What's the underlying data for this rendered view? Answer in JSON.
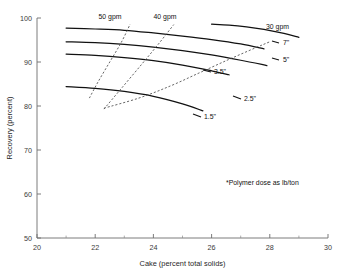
{
  "chart_data": {
    "type": "line",
    "title": "",
    "xlabel": "Cake (percent total solids)",
    "ylabel": "Recovery (percent)",
    "xlim": [
      20,
      30
    ],
    "ylim": [
      50,
      100
    ],
    "xticks": [
      20,
      22,
      24,
      26,
      28,
      30
    ],
    "xticks_minor": [
      21,
      23,
      25,
      27,
      29
    ],
    "yticks": [
      50,
      60,
      70,
      80,
      90,
      100
    ],
    "grid": false,
    "legend": "inline-end-labels",
    "footnote": "*Polymer dose as lb/ton",
    "series": [
      {
        "name": "7\"",
        "label": "7\"",
        "style": "solid",
        "group": "polymer-dose",
        "x": [
          21.0,
          22.0,
          23.0,
          24.0,
          25.0,
          26.0,
          27.0,
          27.8
        ],
        "y": [
          97.7,
          97.5,
          97.2,
          96.6,
          95.9,
          95.1,
          94.1,
          93.0
        ]
      },
      {
        "name": "5\"",
        "label": "5\"",
        "style": "solid",
        "group": "polymer-dose",
        "x": [
          21.0,
          22.0,
          23.0,
          24.0,
          25.0,
          26.0,
          27.0,
          27.9
        ],
        "y": [
          94.6,
          94.4,
          94.0,
          93.4,
          92.6,
          91.6,
          90.4,
          89.2
        ]
      },
      {
        "name": "3.5\"",
        "label": "3.5\"",
        "style": "solid",
        "group": "polymer-dose",
        "x": [
          21.0,
          22.0,
          23.0,
          24.0,
          25.0,
          26.0,
          26.6
        ],
        "y": [
          91.8,
          91.5,
          91.0,
          90.3,
          89.3,
          88.0,
          87.1
        ]
      },
      {
        "name": "2.5\"",
        "label": "2.5\"",
        "style": "solid",
        "group": "polymer-dose",
        "x": [
          26.0,
          26.6,
          27.2,
          27.8,
          28.4,
          29.0
        ],
        "y": [
          98.6,
          98.4,
          98.0,
          97.4,
          96.6,
          95.6
        ]
      },
      {
        "name": "1.5\"",
        "label": "1.5\"",
        "style": "solid",
        "group": "polymer-dose",
        "x": [
          21.0,
          22.0,
          23.0,
          24.0,
          25.0,
          25.7
        ],
        "y": [
          84.4,
          84.0,
          83.3,
          82.2,
          80.5,
          78.9
        ]
      },
      {
        "name": "50 gpm",
        "label": "50 gpm",
        "style": "dashed",
        "group": "flow-rate",
        "x": [
          21.8,
          22.1,
          22.5,
          22.9,
          23.2
        ],
        "y": [
          81.8,
          85.5,
          90.0,
          94.5,
          98.6
        ]
      },
      {
        "name": "40 gpm",
        "label": "40 gpm",
        "style": "dashed",
        "group": "flow-rate",
        "x": [
          22.3,
          22.9,
          23.6,
          24.2,
          24.7
        ],
        "y": [
          79.3,
          84.0,
          89.5,
          94.3,
          98.5
        ]
      },
      {
        "name": "30 gpm",
        "label": "30 gpm",
        "style": "dashed",
        "group": "flow-rate",
        "x": [
          22.3,
          23.5,
          24.6,
          25.6,
          26.6,
          27.5,
          28.0
        ],
        "y": [
          79.5,
          81.8,
          84.6,
          87.6,
          90.6,
          93.2,
          94.6
        ]
      }
    ]
  },
  "axes": {
    "x_title": "Cake (percent total solids)",
    "y_title": "Recovery (percent)",
    "x_tick_labels": [
      "20",
      "22",
      "24",
      "26",
      "28",
      "30"
    ],
    "y_tick_labels": [
      "50",
      "60",
      "70",
      "80",
      "90",
      "100"
    ]
  },
  "annotations": {
    "footnote": "*Polymer dose as lb/ton",
    "curve_labels": {
      "gpm_50": "50 gpm",
      "gpm_40": "40 gpm",
      "gpm_30": "30 gpm",
      "dose_7": "7\"",
      "dose_5": "5\"",
      "dose_3_5": "3.5\"",
      "dose_2_5": "2.5\"",
      "dose_1_5": "1.5\""
    }
  }
}
